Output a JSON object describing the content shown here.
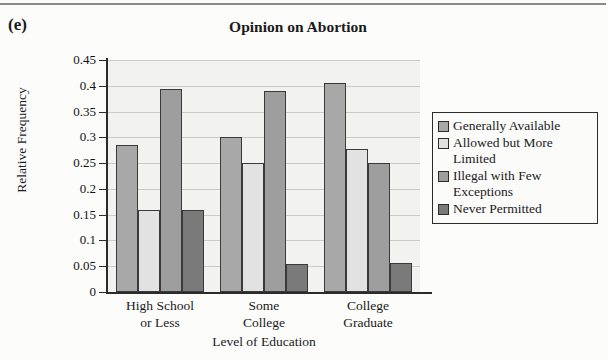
{
  "part_label": "(e)",
  "top_rule": "horizontal-rule",
  "chart_data": {
    "type": "bar",
    "title": "Opinion on Abortion",
    "xlabel": "Level of Education",
    "ylabel": "Relative Frequency",
    "ylim": [
      0,
      0.45
    ],
    "ytick_labels": [
      "0.45",
      "0.4",
      "0.35",
      "0.3",
      "0.25",
      "0.2",
      "0.15",
      "0.1",
      "0.05",
      "0"
    ],
    "ytick_values": [
      0.45,
      0.4,
      0.35,
      0.3,
      0.25,
      0.2,
      0.15,
      0.1,
      0.05,
      0
    ],
    "grid": true,
    "legend_position": "right",
    "categories": [
      "High School\nor Less",
      "Some\nCollege",
      "College\nGraduate"
    ],
    "series": [
      {
        "name": "Generally Available",
        "color": "#a8a8a8",
        "values": [
          0.285,
          0.3,
          0.405
        ]
      },
      {
        "name": "Allowed but More\nLimited",
        "color": "#e2e2e2",
        "values": [
          0.16,
          0.25,
          0.277
        ]
      },
      {
        "name": "Illegal with Few\nExceptions",
        "color": "#9e9e9e",
        "values": [
          0.393,
          0.39,
          0.25
        ]
      },
      {
        "name": "Never Permitted",
        "color": "#7a7a7a",
        "values": [
          0.16,
          0.055,
          0.057
        ]
      }
    ]
  }
}
